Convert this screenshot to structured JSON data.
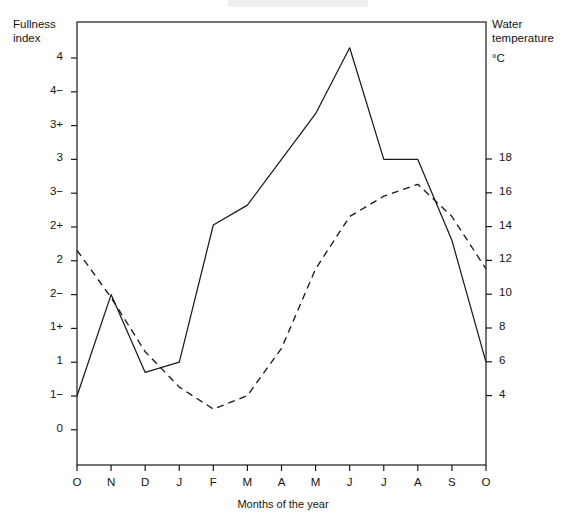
{
  "figure": {
    "xlabel": "Months of the year",
    "left_axis_caption": "Fullness\nindex",
    "right_axis_caption": "Water\ntemperature",
    "right_axis_unit": "°C"
  },
  "chart_data": {
    "type": "line",
    "title": "",
    "xlabel": "Months of the year",
    "ylabel": "Fullness index",
    "y2label": "Water temperature °C",
    "grid": false,
    "legend": null,
    "categories": [
      "O",
      "N",
      "D",
      "J",
      "F",
      "M",
      "A",
      "M",
      "J",
      "J",
      "A",
      "S",
      "O"
    ],
    "x_tick_labels": [
      "O",
      "N",
      "D",
      "J",
      "F",
      "M",
      "A",
      "M",
      "J",
      "J",
      "A",
      "S",
      "O"
    ],
    "y_tick_labels": [
      "4",
      "4−",
      "3+",
      "3",
      "3−",
      "2+",
      "2",
      "2−",
      "1+",
      "1",
      "1−",
      "0"
    ],
    "y_tick_values": [
      4.0,
      3.67,
      3.33,
      3.0,
      2.67,
      2.33,
      2.0,
      1.67,
      1.33,
      1.0,
      0.67,
      0.0
    ],
    "ylim": [
      0,
      4.33
    ],
    "y2_tick_labels": [
      "18",
      "16",
      "14",
      "12",
      "10",
      "8",
      "6",
      "4"
    ],
    "y2_tick_values": [
      18,
      16,
      14,
      12,
      10,
      8,
      6,
      4
    ],
    "y2lim": [
      0.5,
      20.5
    ],
    "series": [
      {
        "name": "Fullness index",
        "axis": "left",
        "style": "solid",
        "color": "#1a1a1a",
        "values": [
          0.67,
          1.67,
          0.9,
          1.0,
          2.35,
          2.55,
          3.0,
          3.45,
          4.1,
          3.0,
          3.0,
          2.2,
          1.0
        ]
      },
      {
        "name": "Water temperature",
        "axis": "right",
        "style": "dashed",
        "color": "#1a1a1a",
        "values": [
          12.6,
          9.8,
          6.6,
          4.5,
          3.2,
          4.0,
          6.8,
          11.5,
          14.6,
          15.8,
          16.5,
          14.6,
          11.5
        ]
      }
    ]
  }
}
